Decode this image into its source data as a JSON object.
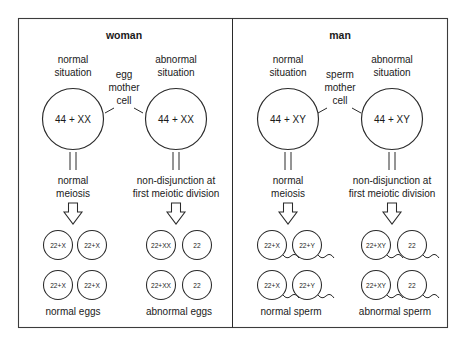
{
  "diagram": {
    "title_hidden": "Non-disjunction during gamete formation",
    "panels": [
      {
        "id": "woman",
        "title": "woman",
        "mother_cell_label_line1": "egg",
        "mother_cell_label_line2": "mother",
        "mother_cell_label_line3": "cell",
        "columns": [
          {
            "id": "woman-normal",
            "situation_line1": "normal",
            "situation_line2": "situation",
            "cell_genotype": "44 + XX",
            "process_line1": "normal",
            "process_line2": "meiosis",
            "gametes": [
              "22+X",
              "22+X",
              "22+X",
              "22+X"
            ],
            "outcome_label": "normal eggs",
            "gamete_type": "egg"
          },
          {
            "id": "woman-abnormal",
            "situation_line1": "abnormal",
            "situation_line2": "situation",
            "cell_genotype": "44 + XX",
            "process_line1": "non-disjunction at",
            "process_line2": "first meiotic division",
            "gametes": [
              "22+XX",
              "22",
              "22+XX",
              "22"
            ],
            "outcome_label": "abnormal eggs",
            "gamete_type": "egg"
          }
        ]
      },
      {
        "id": "man",
        "title": "man",
        "mother_cell_label_line1": "sperm",
        "mother_cell_label_line2": "mother",
        "mother_cell_label_line3": "cell",
        "columns": [
          {
            "id": "man-normal",
            "situation_line1": "normal",
            "situation_line2": "situation",
            "cell_genotype": "44 + XY",
            "process_line1": "normal",
            "process_line2": "meiosis",
            "gametes": [
              "22+X",
              "22+Y",
              "22+X",
              "22+Y"
            ],
            "outcome_label": "normal sperm",
            "gamete_type": "sperm"
          },
          {
            "id": "man-abnormal",
            "situation_line1": "abnormal",
            "situation_line2": "situation",
            "cell_genotype": "44 + XY",
            "process_line1": "non-disjunction at",
            "process_line2": "first meiotic division",
            "gametes": [
              "22+XY",
              "22",
              "22+XY",
              "22"
            ],
            "outcome_label": "abnormal sperm",
            "gamete_type": "sperm"
          }
        ]
      }
    ],
    "colors": {
      "stroke": "#2a2a2a",
      "frame": "#3c3c3c",
      "background": "#ffffff",
      "text": "#1a1a1a"
    }
  }
}
